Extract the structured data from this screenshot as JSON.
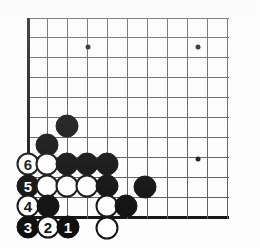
{
  "figure": {
    "board": {
      "cols": 11,
      "rows": 11,
      "origin_x": 28,
      "origin_y": 18,
      "spacing": 19.9,
      "left_edge_col": 0,
      "bottom_edge_row": 10,
      "line_color": "#5a5a5a",
      "edge_color": "#111111",
      "background_color": "#fdfdfd"
    },
    "star_points": [
      {
        "col": 3,
        "row": 1.45
      },
      {
        "col": 8.55,
        "row": 1.45
      },
      {
        "col": 8.55,
        "row": 7.08
      }
    ],
    "stone_colors": {
      "black": "#0b0b0b",
      "white": "#ffffff",
      "white_outline": "#111111",
      "black_label": "#ffffff",
      "white_label": "#111111"
    },
    "stone_radius": 11.5,
    "stones": [
      {
        "name": "black-stone",
        "color": "black",
        "x": 67,
        "y": 126,
        "label": ""
      },
      {
        "name": "black-stone",
        "color": "black",
        "x": 47,
        "y": 145,
        "label": ""
      },
      {
        "name": "white-stone",
        "color": "white",
        "x": 28,
        "y": 164,
        "label": "6"
      },
      {
        "name": "white-stone",
        "color": "white",
        "x": 47,
        "y": 164,
        "label": ""
      },
      {
        "name": "black-stone",
        "color": "black",
        "x": 67,
        "y": 164,
        "label": ""
      },
      {
        "name": "black-stone",
        "color": "black",
        "x": 87,
        "y": 164,
        "label": ""
      },
      {
        "name": "black-stone",
        "color": "black",
        "x": 107,
        "y": 164,
        "label": ""
      },
      {
        "name": "black-stone",
        "color": "black",
        "x": 28,
        "y": 186,
        "label": "5"
      },
      {
        "name": "white-stone",
        "color": "white",
        "x": 47,
        "y": 186,
        "label": ""
      },
      {
        "name": "white-stone",
        "color": "white",
        "x": 67,
        "y": 186,
        "label": ""
      },
      {
        "name": "white-stone",
        "color": "white",
        "x": 87,
        "y": 186,
        "label": ""
      },
      {
        "name": "black-stone",
        "color": "black",
        "x": 107,
        "y": 186,
        "label": ""
      },
      {
        "name": "black-stone",
        "color": "black",
        "x": 145,
        "y": 187,
        "label": ""
      },
      {
        "name": "white-stone",
        "color": "white",
        "x": 28,
        "y": 206,
        "label": "4"
      },
      {
        "name": "black-stone",
        "color": "black",
        "x": 48,
        "y": 206,
        "label": ""
      },
      {
        "name": "white-stone",
        "color": "white",
        "x": 107,
        "y": 206,
        "label": ""
      },
      {
        "name": "black-stone",
        "color": "black",
        "x": 126,
        "y": 206,
        "label": ""
      },
      {
        "name": "black-stone",
        "color": "black",
        "x": 28,
        "y": 227,
        "label": "3"
      },
      {
        "name": "white-stone",
        "color": "white",
        "x": 48,
        "y": 227,
        "label": "2"
      },
      {
        "name": "black-stone",
        "color": "black",
        "x": 68,
        "y": 227,
        "label": "1"
      },
      {
        "name": "white-stone",
        "color": "white",
        "x": 107,
        "y": 228,
        "label": ""
      }
    ],
    "move_sequence": [
      {
        "number": "1",
        "color": "black"
      },
      {
        "number": "2",
        "color": "white"
      },
      {
        "number": "3",
        "color": "black"
      },
      {
        "number": "4",
        "color": "white"
      },
      {
        "number": "5",
        "color": "black"
      },
      {
        "number": "6",
        "color": "white"
      }
    ]
  }
}
